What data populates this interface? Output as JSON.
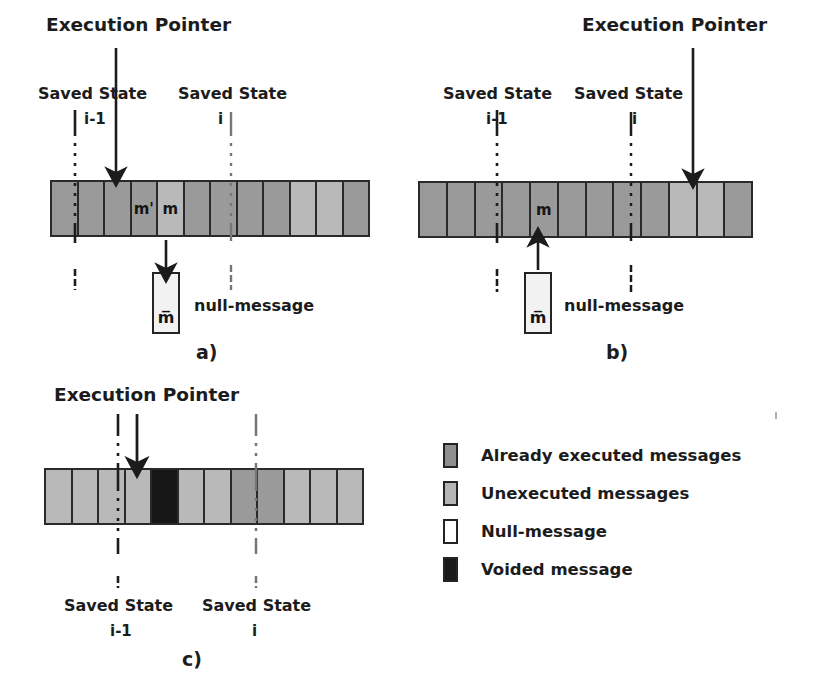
{
  "figure": {
    "caption_letters": [
      "a)",
      "b)",
      "c)"
    ],
    "colors": {
      "already_executed": "#9a9a9a",
      "unexecuted": "#b9b9b9",
      "null_message": "#ffffff",
      "voided_message": "#171717",
      "outline": "#2a2a2a",
      "text": "#1a1a1a"
    }
  },
  "labels": {
    "execution_pointer": "Execution Pointer",
    "saved_state": "Saved State",
    "index_i_minus_1": "i-1",
    "index_i": "i",
    "null_message": "null-message",
    "null_box_symbol": "m̅",
    "msg_m_prime": "m'",
    "msg_m": "m"
  },
  "panels": [
    {
      "id": "a",
      "letter": "a)",
      "execution_pointer_label": "Execution Pointer",
      "saved_state_left_label": "Saved State",
      "saved_state_left_index": "i-1",
      "saved_state_right_label": "Saved State",
      "saved_state_right_index": "i",
      "null_message_label": "null-message",
      "null_box_symbol": "m̅",
      "arrow_direction": "down",
      "cells": [
        {
          "state": "already_executed",
          "text": ""
        },
        {
          "state": "already_executed",
          "text": ""
        },
        {
          "state": "already_executed",
          "text": ""
        },
        {
          "state": "already_executed",
          "text": "m'"
        },
        {
          "state": "unexecuted",
          "text": "m"
        },
        {
          "state": "already_executed",
          "text": ""
        },
        {
          "state": "already_executed",
          "text": ""
        },
        {
          "state": "already_executed",
          "text": ""
        },
        {
          "state": "already_executed",
          "text": ""
        },
        {
          "state": "unexecuted",
          "text": ""
        },
        {
          "state": "unexecuted",
          "text": ""
        },
        {
          "state": "already_executed",
          "text": ""
        }
      ]
    },
    {
      "id": "b",
      "letter": "b)",
      "execution_pointer_label": "Execution Pointer",
      "saved_state_left_label": "Saved State",
      "saved_state_left_index": "i-1",
      "saved_state_right_label": "Saved State",
      "saved_state_right_index": "i",
      "null_message_label": "null-message",
      "null_box_symbol": "m̅",
      "arrow_direction": "up",
      "cells": [
        {
          "state": "already_executed",
          "text": ""
        },
        {
          "state": "already_executed",
          "text": ""
        },
        {
          "state": "already_executed",
          "text": ""
        },
        {
          "state": "already_executed",
          "text": ""
        },
        {
          "state": "already_executed",
          "text": "m"
        },
        {
          "state": "already_executed",
          "text": ""
        },
        {
          "state": "already_executed",
          "text": ""
        },
        {
          "state": "already_executed",
          "text": ""
        },
        {
          "state": "already_executed",
          "text": ""
        },
        {
          "state": "unexecuted",
          "text": ""
        },
        {
          "state": "unexecuted",
          "text": ""
        },
        {
          "state": "already_executed",
          "text": ""
        }
      ]
    },
    {
      "id": "c",
      "letter": "c)",
      "execution_pointer_label": "Execution Pointer",
      "saved_state_left_label": "Saved State",
      "saved_state_left_index": "i-1",
      "saved_state_right_label": "Saved State",
      "saved_state_right_index": "i",
      "arrow_direction": "down",
      "cells": [
        {
          "state": "unexecuted",
          "text": ""
        },
        {
          "state": "unexecuted",
          "text": ""
        },
        {
          "state": "unexecuted",
          "text": ""
        },
        {
          "state": "unexecuted",
          "text": ""
        },
        {
          "state": "voided",
          "text": ""
        },
        {
          "state": "unexecuted",
          "text": ""
        },
        {
          "state": "unexecuted",
          "text": ""
        },
        {
          "state": "already_executed",
          "text": ""
        },
        {
          "state": "already_executed",
          "text": ""
        },
        {
          "state": "unexecuted",
          "text": ""
        },
        {
          "state": "unexecuted",
          "text": ""
        },
        {
          "state": "unexecuted",
          "text": ""
        }
      ]
    }
  ],
  "legend": {
    "items": [
      {
        "swatch": "already_executed",
        "label": "Already executed messages"
      },
      {
        "swatch": "unexecuted",
        "label": "Unexecuted messages"
      },
      {
        "swatch": "null_message",
        "label": "Null-message"
      },
      {
        "swatch": "voided",
        "label": "Voided message"
      }
    ]
  }
}
